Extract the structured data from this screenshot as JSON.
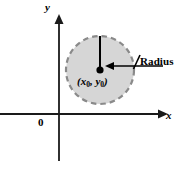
{
  "figure": {
    "type": "coordinate-plane-circle-diagram",
    "background_color": "#ffffff",
    "width": 178,
    "height": 173
  },
  "axes": {
    "x_label": "x",
    "y_label": "y",
    "origin_label": "0",
    "axis_color": "#1a1a1a",
    "origin_point": {
      "x": 59,
      "y": 114
    },
    "x_axis": {
      "from_x": 0,
      "to_x": 165,
      "y": 114,
      "arrow": "right"
    },
    "y_axis": {
      "x": 59,
      "from_y": 160,
      "to_y": 17,
      "arrow": "up"
    }
  },
  "circle": {
    "center": {
      "x": 100,
      "y": 70
    },
    "radius": 34,
    "fill_color": "#d6d6d6",
    "stroke_color": "#8a8a8a",
    "stroke_style": "dashed",
    "stroke_width": 2,
    "center_label": "(x₀, y₀)",
    "center_label_parts": {
      "x_var": "x",
      "y_var": "y",
      "subscript": "0"
    },
    "center_dot_color": "#000000",
    "center_dot_radius": 3.4
  },
  "annotations": {
    "radius_label": "Radius",
    "radius_leader": {
      "from_x": 163,
      "to_x": 107,
      "y": 66,
      "arrow": "left",
      "color": "#000000"
    },
    "radius_tick": {
      "x1": 139,
      "y1": 56,
      "x2": 133,
      "y2": 70,
      "color": "#000000"
    },
    "vertical_radius_line": {
      "x": 100,
      "from_y": 70,
      "to_y": 36,
      "color": "#000000"
    }
  }
}
